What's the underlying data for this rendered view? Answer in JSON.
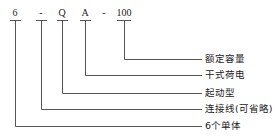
{
  "diagram": {
    "code_parts": [
      {
        "text": "6",
        "x": 15
      },
      {
        "text": "-",
        "x": 41
      },
      {
        "text": "Q",
        "x": 62
      },
      {
        "text": "A",
        "x": 85
      },
      {
        "text": "-",
        "x": 104
      },
      {
        "text": "100",
        "x": 124
      }
    ],
    "labels": [
      {
        "text": "额定容量",
        "y": 59
      },
      {
        "text": "干式荷电",
        "y": 75
      },
      {
        "text": "起动型",
        "y": 93
      },
      {
        "text": "连接线(可省略)",
        "y": 109
      },
      {
        "text": "6个单体",
        "y": 126
      }
    ],
    "colors": {
      "line": "#555555",
      "text": "#222222"
    }
  }
}
